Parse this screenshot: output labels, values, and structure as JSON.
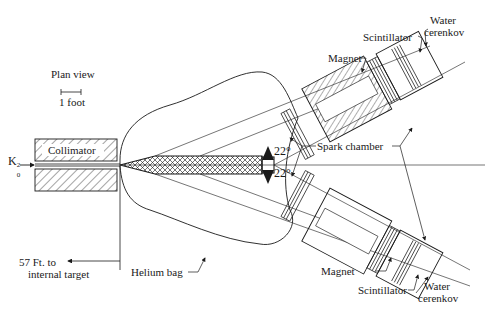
{
  "diagram": {
    "title": "Plan view",
    "scale_bar_label": "1 foot",
    "beam_label": "K",
    "beam_sub": "0",
    "beam_sup": "2",
    "labels": {
      "collimator": "Collimator",
      "target_distance_line1": "57 Ft. to",
      "target_distance_line2": "internal target",
      "helium_bag": "Helium bag",
      "spark_chamber": "Spark chamber",
      "angle_upper": "22°",
      "angle_lower": "22°",
      "magnet_upper": "Magnet",
      "magnet_lower": "Magnet",
      "scintillator_upper": "Scintillator",
      "scintillator_lower": "Scintillator",
      "water_cerenkov_upper_line1": "Water",
      "water_cerenkov_upper_line2": "cerenkov",
      "water_cerenkov_lower_line1": "Water",
      "water_cerenkov_lower_line2": "cerenkov"
    },
    "colors": {
      "ink": "#1a1a1a",
      "background": "#ffffff"
    }
  }
}
